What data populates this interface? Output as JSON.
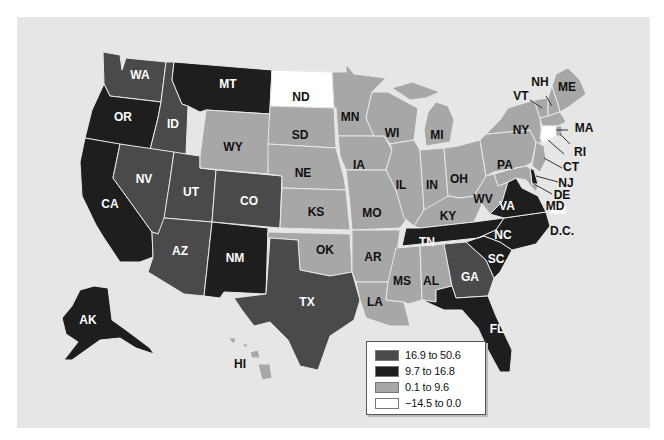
{
  "colors": {
    "high": "#4a4a4a",
    "mid": "#1e1e1e",
    "low": "#a7a7a7",
    "neg": "#ffffff",
    "background": "#e6e6e6"
  },
  "legend": {
    "items": [
      {
        "label": "16.9 to 50.6",
        "color": "#4a4a4a"
      },
      {
        "label": "9.7 to 16.8",
        "color": "#1e1e1e"
      },
      {
        "label": "0.1 to 9.6",
        "color": "#a7a7a7"
      },
      {
        "label": "−14.5 to 0.0",
        "color": "#ffffff"
      }
    ]
  },
  "states": {
    "WA": "high",
    "OR": "mid",
    "CA": "mid",
    "ID": "high",
    "NV": "high",
    "UT": "high",
    "AZ": "high",
    "MT": "mid",
    "WY": "low",
    "CO": "high",
    "NM": "mid",
    "ND": "neg",
    "SD": "low",
    "NE": "low",
    "KS": "low",
    "OK": "low",
    "TX": "high",
    "MN": "low",
    "IA": "low",
    "MO": "low",
    "AR": "low",
    "LA": "low",
    "WI": "low",
    "IL": "low",
    "MI": "low",
    "IN": "low",
    "OH": "low",
    "KY": "low",
    "TN": "mid",
    "MS": "low",
    "AL": "low",
    "GA": "high",
    "FL": "mid",
    "SC": "mid",
    "NC": "mid",
    "VA": "mid",
    "WV": "low",
    "PA": "low",
    "NY": "low",
    "VT": "low",
    "NH": "low",
    "ME": "low",
    "MA": "low",
    "RI": "low",
    "CT": "neg",
    "NJ": "low",
    "DE": "mid",
    "MD": "low",
    "DC": "neg",
    "AK": "mid",
    "HI": "low"
  },
  "labels": {
    "WA": "WA",
    "OR": "OR",
    "CA": "CA",
    "ID": "ID",
    "NV": "NV",
    "UT": "UT",
    "AZ": "AZ",
    "MT": "MT",
    "WY": "WY",
    "CO": "CO",
    "NM": "NM",
    "ND": "ND",
    "SD": "SD",
    "NE": "NE",
    "KS": "KS",
    "OK": "OK",
    "TX": "TX",
    "MN": "MN",
    "IA": "IA",
    "MO": "MO",
    "AR": "AR",
    "LA": "LA",
    "WI": "WI",
    "IL": "IL",
    "MI": "MI",
    "IN": "IN",
    "OH": "OH",
    "KY": "KY",
    "TN": "TN",
    "MS": "MS",
    "AL": "AL",
    "GA": "GA",
    "FL": "FL",
    "SC": "SC",
    "NC": "NC",
    "VA": "VA",
    "WV": "WV",
    "PA": "PA",
    "NY": "NY",
    "VT": "VT",
    "NH": "NH",
    "ME": "ME",
    "MA": "MA",
    "RI": "RI",
    "CT": "CT",
    "NJ": "NJ",
    "DE": "DE",
    "MD": "MD",
    "DC": "D.C.",
    "AK": "AK",
    "HI": "HI"
  }
}
